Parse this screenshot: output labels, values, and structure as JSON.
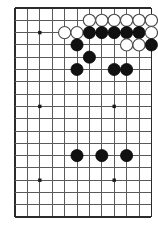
{
  "diagram": {
    "kind": "go-board-diagram",
    "game": "Go",
    "board_label": "Go board position diagram",
    "colors": {
      "background": "#ffffff",
      "grid": "#5a5a5a",
      "grid_edge": "#2b2b2b",
      "black_stone": "#111111",
      "white_stone": "#ffffff",
      "white_stone_outline": "#4a4a4a",
      "star_point": "#1a1a1a"
    },
    "geometry": {
      "image_width": 158,
      "image_height": 232,
      "origin_x": 15,
      "origin_y": 8,
      "spacing_x": 12.4,
      "spacing_y": 12.3,
      "columns": 12,
      "rows": 18,
      "stone_radius": 6.1,
      "star_radius": 1.7
    },
    "edges": {
      "top_edge_row": 0,
      "left_edge_col": 0,
      "right_edge_col": 11,
      "bottom_edge_row": 17
    },
    "star_points": [
      {
        "col": 2,
        "row": 2
      },
      {
        "col": 2,
        "row": 8
      },
      {
        "col": 2,
        "row": 14
      },
      {
        "col": 8,
        "row": 8
      },
      {
        "col": 8,
        "row": 14
      }
    ],
    "stones": [
      {
        "color": "white",
        "col": 6,
        "row": 1,
        "label": "white-stone-c6-r1"
      },
      {
        "color": "white",
        "col": 7,
        "row": 1,
        "label": "white-stone-c7-r1"
      },
      {
        "color": "white",
        "col": 8,
        "row": 1,
        "label": "white-stone-c8-r1"
      },
      {
        "color": "white",
        "col": 9,
        "row": 1,
        "label": "white-stone-c9-r1"
      },
      {
        "color": "white",
        "col": 10,
        "row": 1,
        "label": "white-stone-c10-r1"
      },
      {
        "color": "white",
        "col": 11,
        "row": 1,
        "label": "white-stone-c11-r1"
      },
      {
        "color": "white",
        "col": 4,
        "row": 2,
        "label": "white-stone-c4-r2"
      },
      {
        "color": "white",
        "col": 5,
        "row": 2,
        "label": "white-stone-c5-r2"
      },
      {
        "color": "black",
        "col": 6,
        "row": 2,
        "label": "black-stone-c6-r2"
      },
      {
        "color": "black",
        "col": 7,
        "row": 2,
        "label": "black-stone-c7-r2"
      },
      {
        "color": "black",
        "col": 8,
        "row": 2,
        "label": "black-stone-c8-r2"
      },
      {
        "color": "black",
        "col": 9,
        "row": 2,
        "label": "black-stone-c9-r2"
      },
      {
        "color": "black",
        "col": 10,
        "row": 2,
        "label": "black-stone-c10-r2"
      },
      {
        "color": "white",
        "col": 11,
        "row": 2,
        "label": "white-stone-c11-r2"
      },
      {
        "color": "black",
        "col": 5,
        "row": 3,
        "label": "black-stone-c5-r3"
      },
      {
        "color": "white",
        "col": 9,
        "row": 3,
        "label": "white-stone-c9-r3"
      },
      {
        "color": "white",
        "col": 10,
        "row": 3,
        "label": "white-stone-c10-r3"
      },
      {
        "color": "black",
        "col": 11,
        "row": 3,
        "label": "black-stone-c11-r3"
      },
      {
        "color": "black",
        "col": 6,
        "row": 4,
        "label": "black-stone-c6-r4"
      },
      {
        "color": "black",
        "col": 5,
        "row": 5,
        "label": "black-stone-c5-r5"
      },
      {
        "color": "black",
        "col": 8,
        "row": 5,
        "label": "black-stone-c8-r5"
      },
      {
        "color": "black",
        "col": 9,
        "row": 5,
        "label": "black-stone-c9-r5"
      },
      {
        "color": "black",
        "col": 5,
        "row": 12,
        "label": "black-stone-c5-r12"
      },
      {
        "color": "black",
        "col": 7,
        "row": 12,
        "label": "black-stone-c7-r12"
      },
      {
        "color": "black",
        "col": 9,
        "row": 12,
        "label": "black-stone-c9-r12"
      }
    ]
  }
}
